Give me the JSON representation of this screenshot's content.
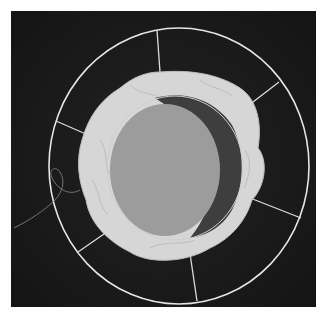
{
  "image": {
    "subject": "wire-frame-with-gathered-fabric",
    "background_color": "#1a1a1a",
    "frame_color": "#e8e8e8",
    "fabric_color": "#d8d8d8",
    "center_color": "#9a9a9a",
    "shadow_color": "#3c3c3c"
  }
}
